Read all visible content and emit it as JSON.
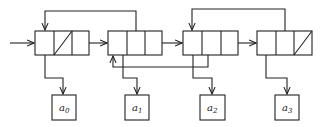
{
  "diagram": {
    "type": "linked-list-structure",
    "stroke_color": "#222222",
    "nodes": [
      {
        "id": "node0",
        "x": 35,
        "y": 31,
        "w": 54,
        "h": 24,
        "null_cell": 1,
        "data_label": "a",
        "data_sub": "0"
      },
      {
        "id": "node1",
        "x": 108,
        "y": 31,
        "w": 54,
        "h": 24,
        "null_cell": null,
        "data_label": "a",
        "data_sub": "1"
      },
      {
        "id": "node2",
        "x": 183,
        "y": 31,
        "w": 55,
        "h": 24,
        "null_cell": null,
        "data_label": "a",
        "data_sub": "2"
      },
      {
        "id": "node3",
        "x": 257,
        "y": 31,
        "w": 55,
        "h": 24,
        "null_cell": 2,
        "data_label": "a",
        "data_sub": "3"
      }
    ],
    "data_boxes": [
      {
        "label": "a",
        "sub": "0"
      },
      {
        "label": "a",
        "sub": "1"
      },
      {
        "label": "a",
        "sub": "2"
      },
      {
        "label": "a",
        "sub": "3"
      }
    ]
  }
}
